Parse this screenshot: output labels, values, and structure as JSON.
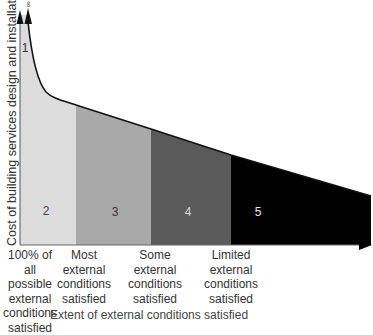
{
  "diagram": {
    "y_axis_label": "Cost of building services design and installation",
    "infinity_symbol": "∞",
    "x_caption": "Extent of external conditions satisfied",
    "regions": [
      {
        "id": "1",
        "label": "1",
        "color": "#dcdcdc"
      },
      {
        "id": "2",
        "label": "2",
        "color": "#dcdcdc"
      },
      {
        "id": "3",
        "label": "3",
        "color": "#a9a9a9"
      },
      {
        "id": "4",
        "label": "4",
        "color": "#5a5a5a"
      },
      {
        "id": "5",
        "label": "5",
        "color": "#000000"
      }
    ],
    "x_categories": [
      {
        "lines": [
          "100% of all",
          "possible",
          "external",
          "conditions",
          "satisfied"
        ]
      },
      {
        "lines": [
          "Most",
          "external",
          "conditions",
          "satisfied"
        ]
      },
      {
        "lines": [
          "Some",
          "external",
          "conditions",
          "satisfied"
        ]
      },
      {
        "lines": [
          "Limited",
          "external",
          "conditions",
          "satisfied"
        ]
      }
    ]
  }
}
